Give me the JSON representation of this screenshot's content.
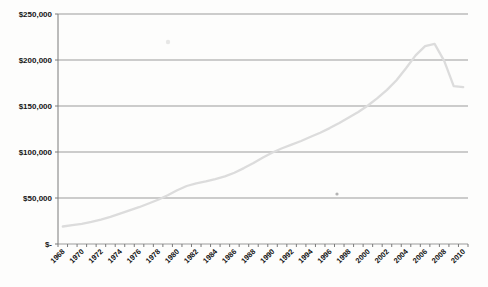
{
  "chart_data": {
    "type": "line",
    "title": "",
    "xlabel": "",
    "ylabel": "",
    "x": [
      1968,
      1969,
      1970,
      1971,
      1972,
      1973,
      1974,
      1975,
      1976,
      1977,
      1978,
      1979,
      1980,
      1981,
      1982,
      1983,
      1984,
      1985,
      1986,
      1987,
      1988,
      1989,
      1990,
      1991,
      1992,
      1993,
      1994,
      1995,
      1996,
      1997,
      1998,
      1999,
      2000,
      2001,
      2002,
      2003,
      2004,
      2005,
      2006,
      2007,
      2008,
      2009,
      2010
    ],
    "values": [
      19000,
      20500,
      22000,
      24000,
      26500,
      29500,
      33000,
      36500,
      40000,
      44000,
      48000,
      53000,
      58500,
      63000,
      66000,
      68000,
      70500,
      73500,
      77500,
      82500,
      88000,
      94000,
      99500,
      104000,
      108000,
      112000,
      116500,
      121000,
      126000,
      131500,
      137500,
      143500,
      150500,
      158500,
      167500,
      178000,
      191000,
      205000,
      215000,
      217500,
      199000,
      171500,
      170500
    ],
    "ylim": [
      0,
      250000
    ],
    "ytick_interval": 50000,
    "ytick_labels": [
      "$-",
      "$50,000",
      "$100,000",
      "$150,000",
      "$200,000",
      "$250,000"
    ],
    "xtick_labels": [
      "1968",
      "1970",
      "1972",
      "1974",
      "1976",
      "1978",
      "1980",
      "1982",
      "1984",
      "1986",
      "1988",
      "1990",
      "1992",
      "1994",
      "1996",
      "1998",
      "2000",
      "2002",
      "2004",
      "2006",
      "2008",
      "2010"
    ],
    "grid": true,
    "legend": "none",
    "line_color": "#dcdcdc",
    "grid_color": "#9b9b9b",
    "axis_color": "#7a7a7a",
    "text_color": "#151515"
  },
  "stray_marks": [
    {
      "x": 337,
      "y": 194
    },
    {
      "x": 168,
      "y": 42
    }
  ]
}
